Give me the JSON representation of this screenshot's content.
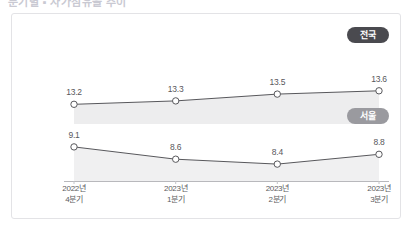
{
  "header": {
    "fragment_text": "분기별 ▪ 자가점유율 추이"
  },
  "chart_data": {
    "type": "line",
    "title": "",
    "subtitle": "",
    "xlabel": "",
    "ylabel": "",
    "grid": false,
    "legend_position": "right",
    "categories": [
      "2022년\n4분기",
      "2023년\n1분기",
      "2023년\n2분기",
      "2023년\n3분기"
    ],
    "categories_line1": [
      "2022년",
      "2023년",
      "2023년",
      "2023년"
    ],
    "categories_line2": [
      "4분기",
      "1분기",
      "2분기",
      "3분기"
    ],
    "series": [
      {
        "name": "전국",
        "values": [
          13.2,
          13.3,
          13.5,
          13.6
        ],
        "labels": [
          "13.2",
          "13.3",
          "13.5",
          "13.6"
        ],
        "color": "#58585c",
        "fill_color": "#ededee",
        "badge_color": "#4a4a4f"
      },
      {
        "name": "서울",
        "values": [
          9.1,
          8.6,
          8.4,
          8.8
        ],
        "labels": [
          "9.1",
          "8.6",
          "8.4",
          "8.8"
        ],
        "color": "#58585c",
        "fill_color": "#f0f0f1",
        "badge_color": "#9a9a9f"
      }
    ],
    "ylim": [
      0,
      14.6
    ],
    "xlim": [
      0,
      3
    ]
  },
  "legend": {
    "national_label": "전국",
    "seoul_label": "서울"
  },
  "colors": {
    "card_border": "#e3e3e6",
    "axis_line": "#b8b8bc",
    "line_stroke": "#58585c",
    "marker_fill": "#ffffff",
    "area_fill_national": "#ededee",
    "area_fill_seoul": "#f0f0f1",
    "text": "#58585c",
    "background": "#ffffff"
  }
}
